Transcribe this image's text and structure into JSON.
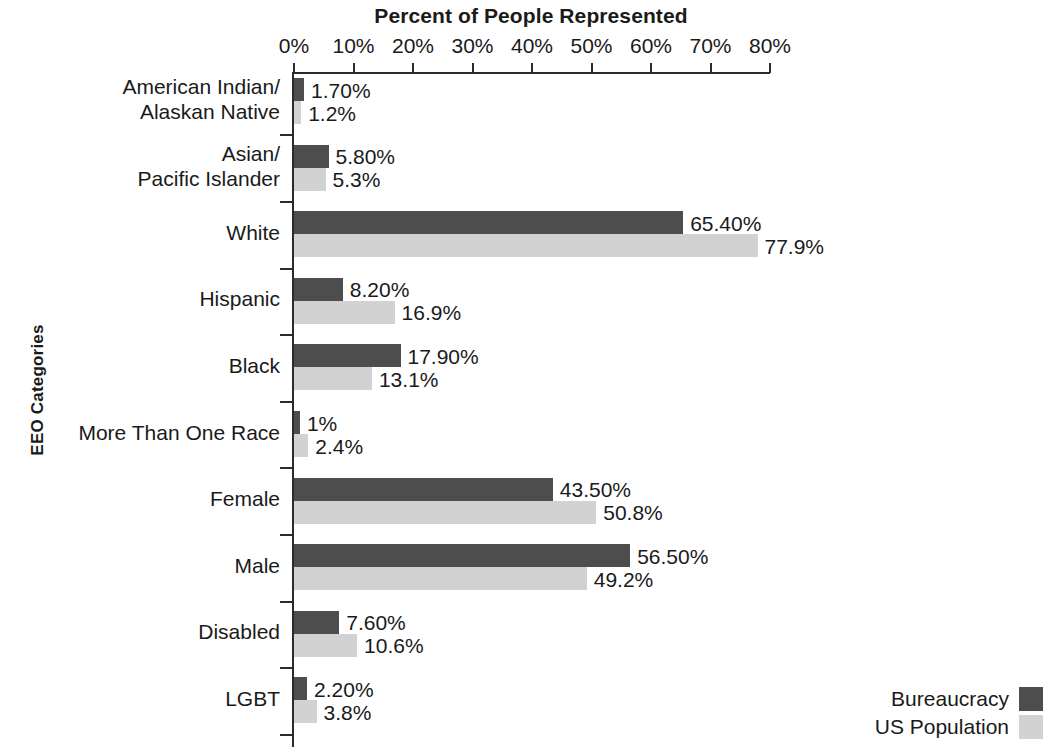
{
  "chart_data": {
    "type": "bar",
    "orientation": "horizontal",
    "title": "Percent of People Represented",
    "xlabel": "Percent of People Represented",
    "ylabel": "EEO Categories",
    "xlim": [
      0,
      80
    ],
    "grid": false,
    "legend_position": "bottom-right",
    "xticks": [
      "0%",
      "10%",
      "20%",
      "30%",
      "40%",
      "50%",
      "60%",
      "70%",
      "80%"
    ],
    "xtick_values": [
      0,
      10,
      20,
      30,
      40,
      50,
      60,
      70,
      80
    ],
    "categories": [
      "American Indian/\nAlaskan Native",
      "Asian/\nPacific Islander",
      "White",
      "Hispanic",
      "Black",
      "More Than One Race",
      "Female",
      "Male",
      "Disabled",
      "LGBT"
    ],
    "series": [
      {
        "name": "Bureaucracy",
        "color": "#4d4d4d",
        "values": [
          1.7,
          5.8,
          65.4,
          8.2,
          17.9,
          1.0,
          43.5,
          56.5,
          7.6,
          2.2
        ],
        "labels": [
          "1.70%",
          "5.80%",
          "65.40%",
          "8.20%",
          "17.90%",
          "1%",
          "43.50%",
          "56.50%",
          "7.60%",
          "2.20%"
        ]
      },
      {
        "name": "US Population",
        "color": "#d2d2d2",
        "values": [
          1.2,
          5.3,
          77.9,
          16.9,
          13.1,
          2.4,
          50.8,
          49.2,
          10.6,
          3.8
        ],
        "labels": [
          "1.2%",
          "5.3%",
          "77.9%",
          "16.9%",
          "13.1%",
          "2.4%",
          "50.8%",
          "49.2%",
          "10.6%",
          "3.8%"
        ]
      }
    ]
  },
  "axis": {
    "title": "Percent of People Represented",
    "y_title": "EEO Categories"
  },
  "legend": {
    "items": [
      {
        "label": "Bureaucracy",
        "key": "bureaucracy"
      },
      {
        "label": "US Population",
        "key": "uspopulation"
      }
    ]
  },
  "source_note": {
    "lines": [
      "n",
      "ic",
      "nsus)"
    ]
  }
}
